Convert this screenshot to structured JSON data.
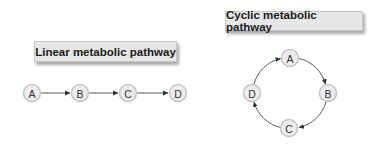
{
  "linear": {
    "title": "Linear metabolic pathway",
    "nodes": [
      "A",
      "B",
      "C",
      "D"
    ],
    "edges": [
      [
        "A",
        "B"
      ],
      [
        "B",
        "C"
      ],
      [
        "C",
        "D"
      ]
    ]
  },
  "cyclic": {
    "title": "Cyclic metabolic pathway",
    "nodes": [
      "A",
      "B",
      "C",
      "D"
    ],
    "edges": [
      [
        "A",
        "B"
      ],
      [
        "B",
        "C"
      ],
      [
        "C",
        "D"
      ],
      [
        "D",
        "A"
      ]
    ]
  },
  "colors": {
    "node_fill": "#ececec",
    "node_stroke": "#c4c4c4",
    "box_fill": "#e6e6e6",
    "arrow": "#333333"
  }
}
